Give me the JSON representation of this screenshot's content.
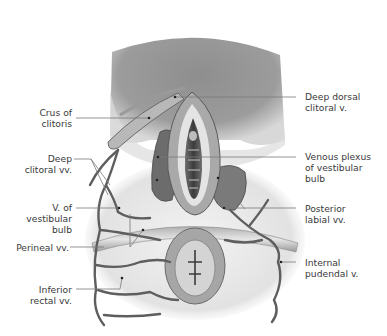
{
  "figure": {
    "view": "Inferior view (lithotomy position)"
  },
  "labels": {
    "left": [
      {
        "id": "crus-of-clitoris",
        "text": "Crus of\nclitoris"
      },
      {
        "id": "deep-clitoral-vv",
        "text": "Deep\nclitoral vv."
      },
      {
        "id": "v-of-vestibular-bulb",
        "text": "V. of\nvestibular\nbulb"
      },
      {
        "id": "perineal-vv",
        "text": "Perineal vv."
      },
      {
        "id": "inferior-rectal-vv",
        "text": "Inferior\nrectal vv."
      }
    ],
    "right": [
      {
        "id": "deep-dorsal-clitoral-v",
        "text": "Deep dorsal\nclitoral v."
      },
      {
        "id": "venous-plexus-of-vestibular-bulb",
        "text": "Venous plexus\nof vestibular\nbulb"
      },
      {
        "id": "posterior-labial-vv",
        "text": "Posterior\nlabial vv."
      },
      {
        "id": "internal-pudendal-v",
        "text": "Internal\npudendal v."
      }
    ]
  },
  "colors": {
    "background": "#ffffff",
    "label_text": "#3a3a3a",
    "leader_line": "#7a7a7a",
    "skin_dark": "#7d7d7d",
    "skin_mid": "#a8a8a8",
    "vein": "#5e5e5e"
  }
}
